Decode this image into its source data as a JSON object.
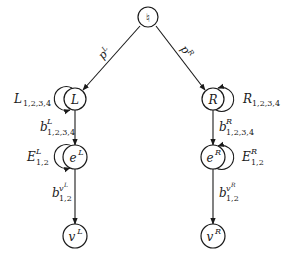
{
  "diagram": {
    "type": "directed-graph",
    "root": {
      "id": "root",
      "label": "♮"
    },
    "nodes": {
      "L": {
        "base": "L",
        "sup": ""
      },
      "eL": {
        "base": "e",
        "sup": "L"
      },
      "vL": {
        "base": "v",
        "sup": "L"
      },
      "R": {
        "base": "R",
        "sup": ""
      },
      "eR": {
        "base": "e",
        "sup": "R"
      },
      "vR": {
        "base": "v",
        "sup": "R"
      }
    },
    "edges": {
      "root_L": {
        "from": "root",
        "to": "L",
        "base": "p",
        "sup": "L"
      },
      "root_R": {
        "from": "root",
        "to": "R",
        "base": "p",
        "sup": "R"
      },
      "L_eL": {
        "from": "L",
        "to": "eL",
        "base": "b",
        "sup": "L",
        "sub": "1,2,3,4"
      },
      "eL_vL": {
        "from": "eL",
        "to": "vL",
        "base": "b",
        "sup": "v",
        "supsup": "L",
        "sub": "1,2"
      },
      "R_eR": {
        "from": "R",
        "to": "eR",
        "base": "b",
        "sup": "R",
        "sub": "1,2,3,4"
      },
      "eR_vR": {
        "from": "eR",
        "to": "vR",
        "base": "b",
        "sup": "v",
        "supsup": "R",
        "sub": "1,2"
      }
    },
    "loops": {
      "L": {
        "node": "L",
        "base": "L",
        "sup": "",
        "sub": "1,2,3,4",
        "side": "left"
      },
      "eL": {
        "node": "eL",
        "base": "E",
        "sup": "L",
        "sub": "1,2",
        "side": "left"
      },
      "R": {
        "node": "R",
        "base": "R",
        "sup": "",
        "sub": "1,2,3,4",
        "side": "right"
      },
      "eR": {
        "node": "eR",
        "base": "E",
        "sup": "R",
        "sub": "1,2",
        "side": "right"
      }
    }
  }
}
